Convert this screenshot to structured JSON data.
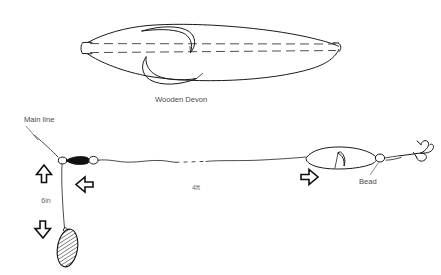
{
  "figure": {
    "background_color": "#ffffff",
    "ink_color": "#1a1a1a",
    "label_color": "#4a4a4a"
  },
  "labels": {
    "wooden_devon": "Wooden Devon",
    "main_line": "Main line",
    "dropper_length": "6in",
    "leader_length": "4ft",
    "bead": "Bead"
  },
  "parts": {
    "devon_body": "wooden-devon-body",
    "devon_fin_upper": "upper-fin",
    "devon_fin_lower": "lower-fin",
    "centre_line": "dashed-centre-line",
    "swivel": "three-way-swivel",
    "swivel_barrel": "swivel-barrel",
    "ring_left": "swivel-ring-left",
    "ring_right": "swivel-ring-right",
    "weight": "hatched-lead-weight",
    "dropper": "dropper-line",
    "leader": "leader-line",
    "small_devon": "small-devon-minnow",
    "bead_ring": "bead",
    "treble_hook": "treble-hook"
  },
  "arrows": {
    "up": "arrow-up",
    "left_upper": "arrow-left-swivel",
    "down": "arrow-down-weight",
    "right": "arrow-right-devon"
  }
}
